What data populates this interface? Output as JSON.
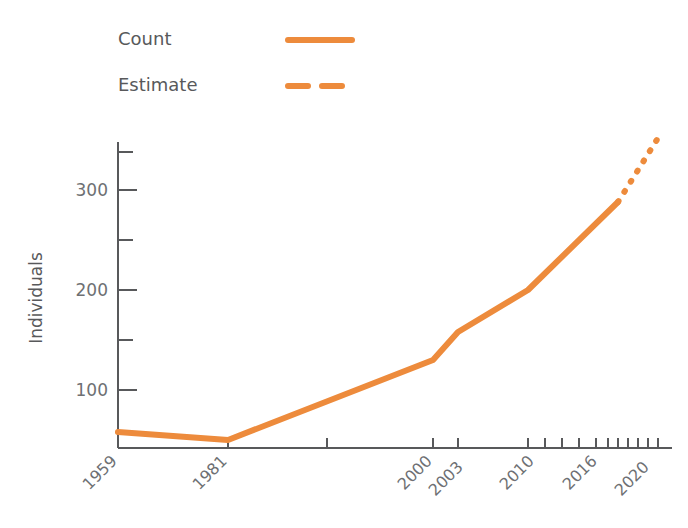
{
  "chart_data": {
    "type": "line",
    "title": "",
    "xlabel": "",
    "ylabel": "Individuals",
    "xlim": [
      1959,
      2020
    ],
    "ylim": [
      42,
      360
    ],
    "grid": false,
    "legend_position": "top-left",
    "x_tick_labels": [
      "1959",
      "1981",
      "2000",
      "2003",
      "2010",
      "2016",
      "2020"
    ],
    "y_tick_labels": [
      "100",
      "200",
      "300"
    ],
    "y_ticks_major": [
      100,
      200,
      300
    ],
    "y_ticks_minor": [
      150,
      250,
      350
    ],
    "x_ticks_all": [
      1959,
      1981,
      1990,
      2000,
      2003,
      2010,
      2011,
      2012,
      2013,
      2014,
      2015,
      2016,
      2017,
      2018,
      2019,
      2020
    ],
    "series": [
      {
        "name": "Count",
        "style": "solid",
        "color": "#ED8B3C",
        "x": [
          1959,
          1981,
          2000,
          2003,
          2010,
          2016
        ],
        "values": [
          58,
          50,
          130,
          158,
          200,
          288
        ]
      },
      {
        "name": "Estimate",
        "style": "dashed",
        "color": "#ED8B3C",
        "x": [
          2016,
          2020
        ],
        "values": [
          288,
          352
        ]
      }
    ]
  },
  "legend": {
    "items": [
      {
        "label": "Count",
        "style": "solid"
      },
      {
        "label": "Estimate",
        "style": "dashed"
      }
    ]
  },
  "colors": {
    "accent": "#ED8B3C",
    "axis": "#58595b",
    "text": "#6e7073",
    "background": "#ffffff"
  }
}
